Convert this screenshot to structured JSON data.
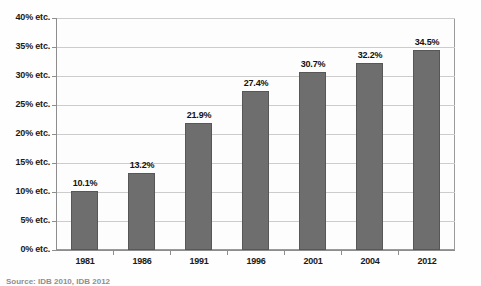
{
  "chart_data": {
    "type": "bar",
    "title": "",
    "xlabel": "",
    "ylabel": "",
    "categories": [
      "1981",
      "1986",
      "1991",
      "1996",
      "2001",
      "2004",
      "2012"
    ],
    "values": [
      10.1,
      13.2,
      21.9,
      27.4,
      30.7,
      32.2,
      34.5
    ],
    "value_labels": [
      "10.1%",
      "13.2%",
      "21.9%",
      "27.4%",
      "30.7%",
      "32.2%",
      "34.5%"
    ],
    "ylim": [
      0,
      40
    ],
    "ytick_values": [
      0,
      5,
      10,
      15,
      20,
      25,
      30,
      35,
      40
    ],
    "ytick_labels": [
      "0% etc.",
      "5% etc.",
      "10% etc.",
      "15% etc.",
      "20% etc.",
      "25% etc.",
      "30% etc.",
      "35% etc.",
      "40% etc."
    ],
    "grid": true,
    "legend": null,
    "bar_color": "#6e6e6e",
    "bar_border_color": "#575757",
    "gridline_color": "#cccccc",
    "axis_color": "#8d8d8d",
    "plot_background": "#fdfdfd"
  },
  "footer": {
    "source_note": "Source: IDB 2010, IDB 2012"
  }
}
